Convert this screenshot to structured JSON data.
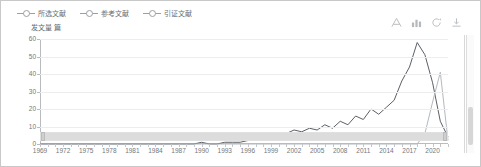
{
  "legend": {
    "items": [
      {
        "label": "所选文献",
        "color": "#5b6066",
        "icon": "line-marker-icon"
      },
      {
        "label": "参考文献",
        "color": "#8e949a",
        "icon": "line-marker-icon"
      },
      {
        "label": "引证文献",
        "color": "#b4b9be",
        "icon": "line-marker-icon"
      }
    ]
  },
  "toolbar": {
    "items": [
      {
        "name": "data-view-icon",
        "label": "数据视图"
      },
      {
        "name": "bar-chart-icon",
        "label": "切换为柱状图"
      },
      {
        "name": "refresh-icon",
        "label": "还原"
      },
      {
        "name": "download-icon",
        "label": "保存为图片"
      }
    ]
  },
  "chart_data": {
    "type": "line",
    "title": "",
    "ylabel": "发文量 篇",
    "xlabel": "",
    "ylim": [
      0,
      60
    ],
    "yticks": [
      0,
      10,
      20,
      30,
      40,
      50,
      60
    ],
    "grid": true,
    "legend_position": "top-left",
    "xtick_labels": [
      "1969",
      "1972",
      "1975",
      "1978",
      "1981",
      "1984",
      "1987",
      "1990",
      "1993",
      "1996",
      "1999",
      "2002",
      "2005",
      "2008",
      "2011",
      "2014",
      "2017",
      "2020"
    ],
    "x": [
      1969,
      1970,
      1971,
      1972,
      1973,
      1974,
      1975,
      1976,
      1977,
      1978,
      1979,
      1980,
      1981,
      1982,
      1983,
      1984,
      1985,
      1986,
      1987,
      1988,
      1989,
      1990,
      1991,
      1992,
      1993,
      1994,
      1995,
      1996,
      1997,
      1998,
      1999,
      2000,
      2001,
      2002,
      2003,
      2004,
      2005,
      2006,
      2007,
      2008,
      2009,
      2010,
      2011,
      2012,
      2013,
      2014,
      2015,
      2016,
      2017,
      2018,
      2019,
      2020,
      2021,
      2022
    ],
    "series": [
      {
        "name": "所选文献",
        "color": "#5b6066",
        "values": [
          0,
          0,
          0,
          0,
          0,
          0,
          0,
          0,
          0,
          0,
          0,
          0,
          0,
          0,
          0,
          0,
          0,
          0,
          0,
          0,
          0,
          1,
          0,
          0,
          1,
          1,
          1,
          2,
          4,
          3,
          2,
          3,
          6,
          8,
          7,
          9,
          8,
          11,
          9,
          13,
          11,
          16,
          14,
          20,
          17,
          21,
          25,
          36,
          44,
          58,
          51,
          35,
          13,
          4
        ]
      },
      {
        "name": "引证文献",
        "color": "#b4b9be",
        "values": [
          0,
          0,
          0,
          0,
          0,
          0,
          0,
          0,
          0,
          0,
          0,
          0,
          0,
          0,
          0,
          0,
          0,
          0,
          0,
          0,
          0,
          0,
          0,
          0,
          0,
          0,
          0,
          0,
          0,
          0,
          0,
          0,
          0,
          0,
          0,
          0,
          0,
          0,
          0,
          0,
          0,
          0,
          0,
          0,
          0,
          0,
          0,
          0,
          0,
          0,
          6,
          24,
          41,
          2
        ]
      }
    ]
  },
  "datazoom": {
    "start_percent": 0,
    "end_percent": 100
  }
}
